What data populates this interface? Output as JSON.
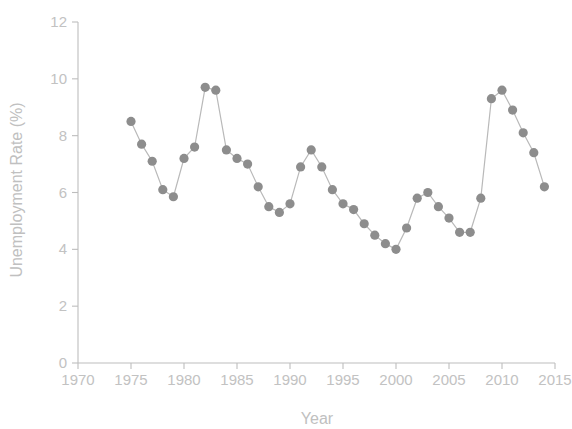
{
  "chart_data": {
    "type": "line",
    "title": "",
    "xlabel": "Year",
    "ylabel": "Unemployment Rate (%)",
    "xlim": [
      1970,
      2015
    ],
    "ylim": [
      0,
      12
    ],
    "xticks": [
      1970,
      1975,
      1980,
      1985,
      1990,
      1995,
      2000,
      2005,
      2010,
      2015
    ],
    "xtick_labels": [
      "1970",
      "1975",
      "1980",
      "1985",
      "1990",
      "1995",
      "2000",
      "2005",
      "2010",
      "2015"
    ],
    "yticks": [
      0,
      2,
      4,
      6,
      8,
      10,
      12
    ],
    "ytick_labels": [
      "0",
      "2",
      "4",
      "6",
      "8",
      "10",
      "12"
    ],
    "grid": false,
    "legend": null,
    "marker": "circle",
    "marker_color": "#8d8d8d",
    "line_color": "#b9b9b9",
    "axis_color": "#bdbdbd",
    "text_color": "#c2c2c2",
    "background_color": "#ffffff",
    "x": [
      1975,
      1976,
      1977,
      1978,
      1979,
      1980,
      1981,
      1982,
      1983,
      1984,
      1985,
      1986,
      1987,
      1988,
      1989,
      1990,
      1991,
      1992,
      1993,
      1994,
      1995,
      1996,
      1997,
      1998,
      1999,
      2000,
      2001,
      2002,
      2003,
      2004,
      2005,
      2006,
      2007,
      2008,
      2009,
      2010,
      2011,
      2012,
      2013,
      2014
    ],
    "values": [
      8.5,
      7.7,
      7.1,
      6.1,
      5.85,
      7.2,
      7.6,
      9.7,
      9.6,
      7.5,
      7.2,
      7.0,
      6.2,
      5.5,
      5.3,
      5.6,
      6.9,
      7.5,
      6.9,
      6.1,
      5.6,
      5.4,
      4.9,
      4.5,
      4.2,
      4.0,
      4.75,
      5.8,
      6.0,
      5.5,
      5.1,
      4.6,
      4.6,
      5.8,
      9.3,
      9.6,
      8.9,
      8.1,
      7.4,
      6.2
    ],
    "series": [
      {
        "name": "Unemployment Rate",
        "x": [
          1975,
          1976,
          1977,
          1978,
          1979,
          1980,
          1981,
          1982,
          1983,
          1984,
          1985,
          1986,
          1987,
          1988,
          1989,
          1990,
          1991,
          1992,
          1993,
          1994,
          1995,
          1996,
          1997,
          1998,
          1999,
          2000,
          2001,
          2002,
          2003,
          2004,
          2005,
          2006,
          2007,
          2008,
          2009,
          2010,
          2011,
          2012,
          2013,
          2014
        ],
        "values": [
          8.5,
          7.7,
          7.1,
          6.1,
          5.85,
          7.2,
          7.6,
          9.7,
          9.6,
          7.5,
          7.2,
          7.0,
          6.2,
          5.5,
          5.3,
          5.6,
          6.9,
          7.5,
          6.9,
          6.1,
          5.6,
          5.4,
          4.9,
          4.5,
          4.2,
          4.0,
          4.75,
          5.8,
          6.0,
          5.5,
          5.1,
          4.6,
          4.6,
          5.8,
          9.3,
          9.6,
          8.9,
          8.1,
          7.4,
          6.2
        ]
      }
    ]
  }
}
